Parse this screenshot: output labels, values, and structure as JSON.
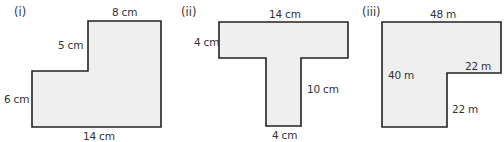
{
  "figures": [
    {
      "id": "i",
      "label": "(i)",
      "shape": "L-shape (step at top-left)",
      "dimensions": {
        "top": "8 cm",
        "step_vertical": "5 cm",
        "left": "6 cm",
        "bottom": "14 cm"
      }
    },
    {
      "id": "ii",
      "label": "(ii)",
      "shape": "T-shape",
      "dimensions": {
        "top": "14 cm",
        "bar_height": "4 cm",
        "stem_height": "10 cm",
        "stem_width": "4 cm"
      }
    },
    {
      "id": "iii",
      "label": "(iii)",
      "shape": "L-shape (notch at bottom-right)",
      "dimensions": {
        "top": "48 m",
        "left": "40 m",
        "notch_horizontal": "22 m",
        "notch_vertical": "22 m"
      }
    }
  ],
  "colors": {
    "fill": "#efefef",
    "stroke": "#222222",
    "text": "#333333"
  }
}
